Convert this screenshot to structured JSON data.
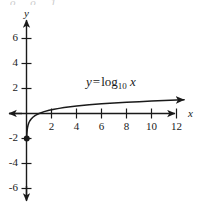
{
  "figure": {
    "background_color": "#ffffff",
    "ink_color": "#1a1a1a",
    "clipped_top_fragment": "o o 1"
  },
  "equation": {
    "lhs": "y",
    "equals": "=",
    "function": "log",
    "base": "10",
    "argument": "x"
  },
  "axes": {
    "x_axis_name": "x",
    "y_axis_name": "y",
    "x_ticks": [
      "2",
      "4",
      "6",
      "8",
      "10",
      "12"
    ],
    "y_ticks": [
      "6",
      "4",
      "2",
      "-2",
      "-4",
      "-6"
    ]
  },
  "chart_data": {
    "type": "line",
    "title": "",
    "subtitle": "",
    "xlabel": "x",
    "ylabel": "y",
    "xlim": [
      -1.2,
      13.6
    ],
    "ylim": [
      -7.6,
      7.4
    ],
    "grid": false,
    "legend": null,
    "annotations": [
      {
        "text": "y = log_10 x",
        "x": 5.0,
        "y": 2.1
      }
    ],
    "xticks": [
      2,
      4,
      6,
      8,
      10,
      12
    ],
    "yticks": [
      -6,
      -4,
      -2,
      2,
      4,
      6
    ],
    "series": [
      {
        "name": "y = log10 x",
        "function": "log10",
        "x": [
          0.01,
          0.02,
          0.03,
          0.05,
          0.08,
          0.12,
          0.18,
          0.25,
          0.35,
          0.5,
          0.7,
          1.0,
          1.4,
          1.8,
          2.2,
          2.6,
          3.0,
          3.5,
          4.0,
          5.0,
          6.0,
          7.0,
          8.0,
          9.0,
          10.0,
          11.0,
          12.0,
          12.6
        ],
        "y": [
          -2.0,
          -1.7,
          -1.52,
          -1.3,
          -1.1,
          -0.92,
          -0.74,
          -0.6,
          -0.46,
          -0.3,
          -0.15,
          0.0,
          0.15,
          0.26,
          0.34,
          0.41,
          0.48,
          0.54,
          0.6,
          0.7,
          0.78,
          0.85,
          0.9,
          0.95,
          1.0,
          1.04,
          1.08,
          1.1
        ],
        "arrow_end": true,
        "endpoint_marker": {
          "x": 0.01,
          "y": -2.0,
          "style": "dot"
        }
      }
    ]
  }
}
